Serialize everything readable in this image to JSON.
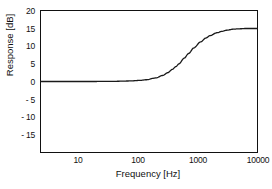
{
  "chart_data": {
    "type": "line",
    "title": "",
    "xlabel": "Frequency  [Hz]",
    "ylabel": "Response  [dB]",
    "xscale": "log",
    "xlim": [
      2.3,
      22000
    ],
    "ylim": [
      -20,
      20
    ],
    "grid": false,
    "legend": null,
    "xticks": [
      10,
      100,
      1000,
      10000
    ],
    "xtick_labels": [
      "10",
      "100",
      "1000",
      "10000"
    ],
    "yticks": [
      20,
      15,
      10,
      5,
      0,
      -5,
      -10,
      -15
    ],
    "ytick_labels": [
      "20",
      "15",
      "10",
      "5",
      "0",
      "- 5",
      "- 10",
      "- 15"
    ],
    "series": [
      {
        "name": "Response",
        "color": "#1a1a1a",
        "x": [
          2.3,
          5,
          10,
          20,
          50,
          100,
          150,
          200,
          300,
          400,
          500,
          600,
          700,
          800,
          1000,
          1200,
          1500,
          2000,
          2500,
          3000,
          4000,
          5000,
          6000,
          8000,
          10000,
          14000,
          18000,
          22000
        ],
        "y": [
          0.0,
          0.0,
          0.0,
          0.0,
          0.05,
          0.15,
          0.3,
          0.5,
          1.0,
          1.7,
          2.5,
          3.4,
          4.2,
          5.0,
          6.6,
          7.9,
          9.5,
          11.2,
          12.3,
          13.0,
          13.8,
          14.2,
          14.5,
          14.8,
          14.9,
          15.0,
          15.0,
          15.0
        ]
      }
    ]
  },
  "axes": {
    "ytick_positions_px": [
      11.0,
      28.7,
      46.4,
      64.1,
      81.8,
      99.5,
      117.2,
      134.9
    ],
    "xtick_positions_px": [
      78,
      138,
      198,
      258
    ]
  }
}
